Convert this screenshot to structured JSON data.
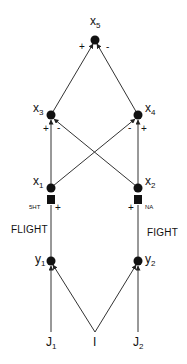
{
  "diagram": {
    "nodes": {
      "x5": {
        "base": "x",
        "sub": "5"
      },
      "x3": {
        "base": "x",
        "sub": "3"
      },
      "x4": {
        "base": "x",
        "sub": "4"
      },
      "x1": {
        "base": "x",
        "sub": "1"
      },
      "x2": {
        "base": "x",
        "sub": "2"
      },
      "y1": {
        "base": "y",
        "sub": "1"
      },
      "y2": {
        "base": "y",
        "sub": "2"
      },
      "J1": {
        "base": "J",
        "sub": "1"
      },
      "I": {
        "base": "I",
        "sub": ""
      },
      "J2": {
        "base": "J",
        "sub": "2"
      }
    },
    "signs": {
      "x3_to_x5": "+",
      "x4_to_x5": "-",
      "x1_to_x3": "+",
      "x2_to_x3": "-",
      "x1_to_x4": "-",
      "x2_to_x4": "+",
      "y1_to_x1": "+",
      "y2_to_x2": "+"
    },
    "modulators": {
      "left": "5HT",
      "right": "NA"
    },
    "pathway_labels": {
      "left": "FLIGHT",
      "right": "FIGHT"
    },
    "edges": [
      {
        "from": "x3",
        "to": "x5",
        "sign": "+"
      },
      {
        "from": "x4",
        "to": "x5",
        "sign": "-"
      },
      {
        "from": "x1",
        "to": "x3",
        "sign": "+"
      },
      {
        "from": "x2",
        "to": "x3",
        "sign": "-"
      },
      {
        "from": "x1",
        "to": "x4",
        "sign": "-"
      },
      {
        "from": "x2",
        "to": "x4",
        "sign": "+"
      },
      {
        "from": "y1",
        "to": "x1",
        "sign": "+"
      },
      {
        "from": "y2",
        "to": "x2",
        "sign": "+"
      },
      {
        "from": "J1",
        "to": "y1",
        "sign": ""
      },
      {
        "from": "I",
        "to": "y1",
        "sign": ""
      },
      {
        "from": "I",
        "to": "y2",
        "sign": ""
      },
      {
        "from": "J2",
        "to": "y2",
        "sign": ""
      }
    ]
  }
}
